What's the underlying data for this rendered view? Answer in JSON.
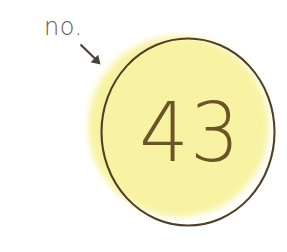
{
  "figure": {
    "background_color": "#ffffff"
  },
  "caption": {
    "text": "no.",
    "color": "#615952"
  },
  "pointer": {
    "icon": "arrow-down-right-icon",
    "color": "#4d4038",
    "from": "81,45",
    "to": "99,64",
    "points_to": "badge-circle"
  },
  "badge": {
    "value": "43",
    "fill_color": "#f8f3a2",
    "outline_color": "#4f4026",
    "value_color": "#6b5527",
    "center_x": 188,
    "center_y": 132,
    "radius": 90
  }
}
